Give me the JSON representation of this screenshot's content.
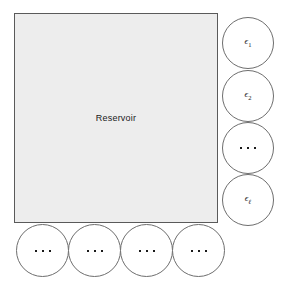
{
  "diagram": {
    "reservoir": {
      "label": "Reservoir",
      "fill_color": "#ededed",
      "border_color": "#5a5a5a"
    },
    "right_nodes": [
      {
        "name": "epsilon-1",
        "base": "ϵ",
        "sub": "1",
        "sub_style": "number"
      },
      {
        "name": "epsilon-2",
        "base": "ϵ",
        "sub": "2",
        "sub_style": "number"
      },
      {
        "name": "ellipsis",
        "base": "",
        "sub": "",
        "sub_style": "dots"
      },
      {
        "name": "epsilon-ell",
        "base": "ϵ",
        "sub": "ℓ",
        "sub_style": "ell"
      }
    ],
    "bottom_nodes": [
      {
        "name": "ellipsis-1",
        "sub_style": "dots"
      },
      {
        "name": "ellipsis-2",
        "sub_style": "dots"
      },
      {
        "name": "ellipsis-3",
        "sub_style": "dots"
      },
      {
        "name": "ellipsis-4",
        "sub_style": "dots"
      }
    ],
    "node_style": {
      "fill_color": "#ffffff",
      "border_color": "#6e6e6e"
    },
    "background_color": "#ffffff"
  }
}
